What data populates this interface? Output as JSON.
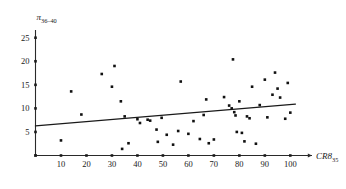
{
  "chart_data": {
    "type": "scatter",
    "title": "",
    "subtitle": "",
    "xlabel": "CR8",
    "xlabel_sub": "35",
    "ylabel": "π",
    "ylabel_sub": "36–40",
    "xlim": [
      0,
      104
    ],
    "ylim": [
      0,
      26
    ],
    "xticks": [
      10,
      20,
      30,
      40,
      50,
      60,
      70,
      80,
      90,
      100
    ],
    "yticks": [
      5,
      10,
      15,
      20,
      25
    ],
    "grid": false,
    "legend": "none",
    "marker": "square",
    "marker_size": 2.6,
    "series": [
      {
        "name": "observations",
        "points": [
          [
            10.0,
            3.2
          ],
          [
            14.0,
            13.6
          ],
          [
            18.0,
            8.7
          ],
          [
            26.0,
            17.3
          ],
          [
            30.0,
            14.6
          ],
          [
            31.0,
            19.0
          ],
          [
            33.5,
            11.5
          ],
          [
            34.0,
            1.4
          ],
          [
            35.0,
            8.3
          ],
          [
            36.5,
            2.6
          ],
          [
            40.0,
            7.7
          ],
          [
            41.0,
            6.9
          ],
          [
            44.0,
            7.6
          ],
          [
            45.0,
            7.4
          ],
          [
            47.5,
            5.5
          ],
          [
            48.0,
            2.9
          ],
          [
            49.5,
            8.0
          ],
          [
            51.5,
            4.4
          ],
          [
            54.0,
            2.3
          ],
          [
            56.0,
            5.2
          ],
          [
            57.0,
            15.7
          ],
          [
            60.0,
            4.6
          ],
          [
            62.0,
            7.3
          ],
          [
            64.5,
            3.5
          ],
          [
            66.0,
            8.6
          ],
          [
            67.0,
            11.9
          ],
          [
            68.0,
            2.6
          ],
          [
            70.0,
            3.4
          ],
          [
            74.0,
            12.4
          ],
          [
            76.0,
            10.6
          ],
          [
            77.0,
            10.0
          ],
          [
            77.5,
            20.4
          ],
          [
            78.0,
            9.2
          ],
          [
            78.5,
            8.5
          ],
          [
            79.0,
            5.0
          ],
          [
            80.0,
            11.5
          ],
          [
            81.0,
            4.8
          ],
          [
            82.0,
            3.0
          ],
          [
            83.0,
            8.3
          ],
          [
            84.0,
            7.9
          ],
          [
            85.0,
            14.6
          ],
          [
            86.5,
            2.5
          ],
          [
            88.0,
            10.7
          ],
          [
            90.0,
            16.1
          ],
          [
            91.0,
            8.1
          ],
          [
            93.0,
            12.9
          ],
          [
            94.0,
            17.6
          ],
          [
            95.0,
            14.2
          ],
          [
            96.0,
            12.3
          ],
          [
            98.0,
            7.8
          ],
          [
            99.0,
            15.4
          ],
          [
            100.0,
            9.1
          ]
        ]
      }
    ],
    "trendline": {
      "name": "fitted regression line",
      "x_start": 0,
      "y_start": 6.3,
      "x_end": 102,
      "y_end": 10.9
    }
  }
}
